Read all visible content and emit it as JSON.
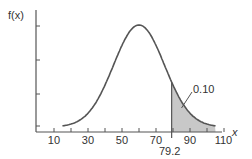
{
  "chart_data": {
    "type": "area",
    "title": "",
    "xlabel": "x",
    "ylabel": "f(x)",
    "distribution": "normal",
    "mean": 60,
    "std_dev": 15,
    "x_ticks_labeled": [
      10,
      30,
      50,
      70,
      90,
      110
    ],
    "x_ticks_minor": [
      10,
      20,
      30,
      40,
      50,
      60,
      70,
      80,
      90,
      100,
      110
    ],
    "xlim": [
      0,
      115
    ],
    "y_tick_count": 4,
    "y_tick_labels": [],
    "grid": false,
    "legend": null,
    "shaded_region": {
      "from": 79.2,
      "to": 105,
      "area": 0.1,
      "fill": "#c8c8c8"
    },
    "annotations": [
      {
        "text": "0.10",
        "points_to": "shaded tail area"
      },
      {
        "text": "79.2",
        "position": "below x-axis at x=79.2"
      }
    ],
    "curve_x_range": [
      15,
      105
    ]
  },
  "labels": {
    "y_axis": "f(x)",
    "x_axis": "x",
    "tail_area": "0.10",
    "cutoff": "79.2",
    "x_ticks": [
      "10",
      "30",
      "50",
      "70",
      "90",
      "110"
    ]
  },
  "colors": {
    "curve": "#555555",
    "axis": "#555555",
    "shade": "#c8c8c8"
  }
}
